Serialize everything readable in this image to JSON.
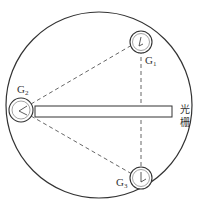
{
  "diagram": {
    "type": "schematic",
    "outer_circle": {
      "cx": 99,
      "cy": 105,
      "r": 93
    },
    "grating": {
      "label_line1": "光",
      "label_line2": "栅",
      "rect": {
        "x": 35,
        "y": 106,
        "width": 137,
        "height": 11
      }
    },
    "gauges": [
      {
        "id": "G1",
        "letter": "G",
        "subscript": "1",
        "cx": 141,
        "cy": 42,
        "r": 11
      },
      {
        "id": "G2",
        "letter": "G",
        "subscript": "2",
        "cx": 21,
        "cy": 110,
        "r": 12
      },
      {
        "id": "G3",
        "letter": "G",
        "subscript": "3",
        "cx": 141,
        "cy": 178,
        "r": 11
      }
    ],
    "connections": [
      {
        "from": "G2",
        "to": "G1",
        "style": "dashed"
      },
      {
        "from": "G2",
        "to": "G3",
        "style": "dashed"
      },
      {
        "from": "G1",
        "to": "G3",
        "style": "dashed"
      }
    ],
    "colors": {
      "stroke": "#333333",
      "background": "#ffffff"
    }
  }
}
